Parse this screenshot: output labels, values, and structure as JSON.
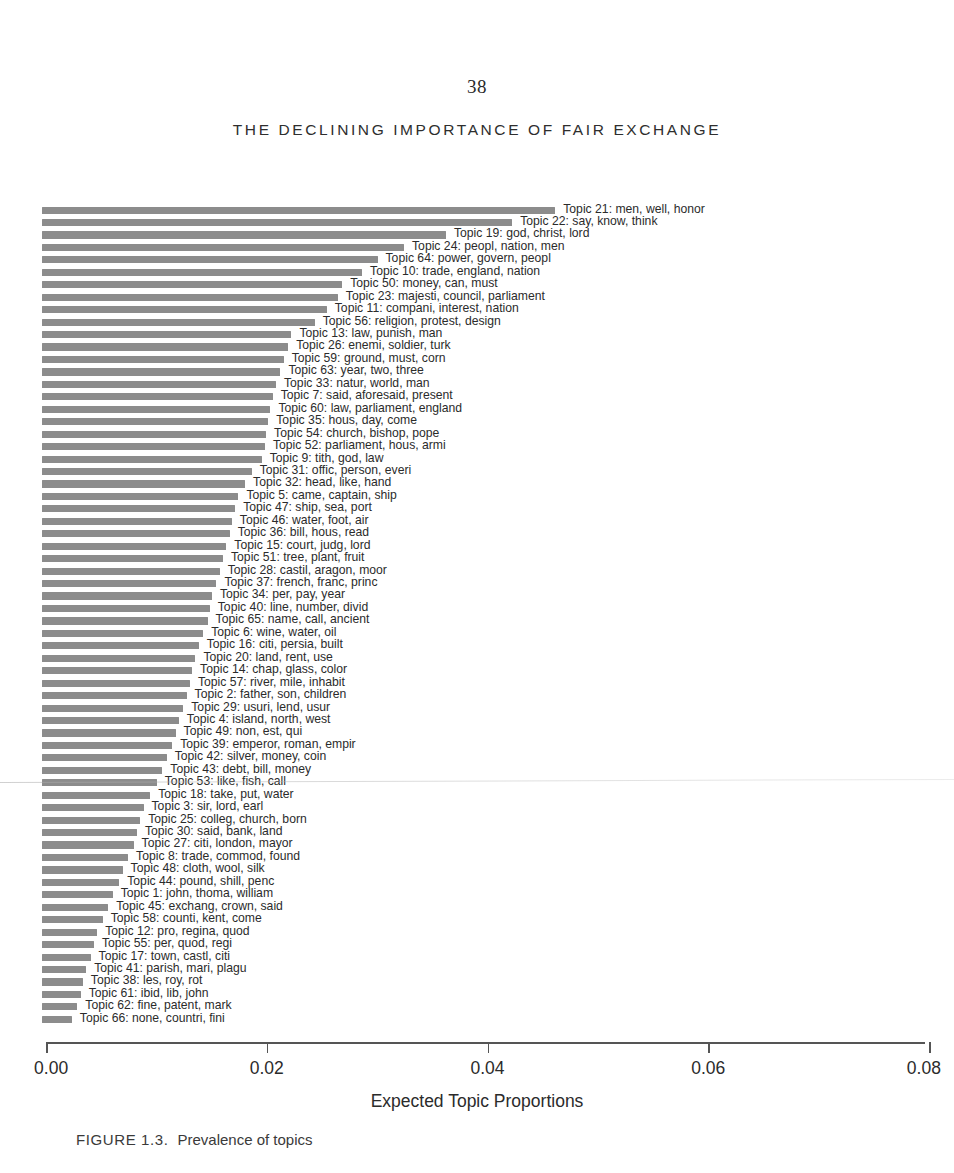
{
  "page": {
    "number": "38",
    "running_head": "THE DECLINING IMPORTANCE OF FAIR EXCHANGE"
  },
  "caption": {
    "figure_number": "FIGURE 1.3.",
    "text": "Prevalence of topics"
  },
  "chart_data": {
    "type": "bar",
    "orientation": "horizontal",
    "title": "Prevalence of topics",
    "xlabel": "Expected Topic Proportions",
    "ylabel": "",
    "xlim": [
      0.0,
      0.08
    ],
    "xticks": [
      "0.00",
      "0.02",
      "0.04",
      "0.06",
      "0.08"
    ],
    "xtick_values": [
      0.0,
      0.02,
      0.04,
      0.06,
      0.08
    ],
    "grid": false,
    "legend": null,
    "bar_color": "#8c8c8c",
    "categories": [
      "Topic 21: men, well, honor",
      "Topic 22: say, know, think",
      "Topic 19: god, christ, lord",
      "Topic 24: peopl, nation, men",
      "Topic 64: power, govern, peopl",
      "Topic 10: trade, england, nation",
      "Topic 50: money, can, must",
      "Topic 23: majesti, council, parliament",
      "Topic 11: compani, interest, nation",
      "Topic 56: religion, protest, design",
      "Topic 13: law, punish, man",
      "Topic 26: enemi, soldier, turk",
      "Topic 59: ground, must, corn",
      "Topic 63: year, two, three",
      "Topic 33: natur, world, man",
      "Topic 7: said, aforesaid, present",
      "Topic 60: law, parliament, england",
      "Topic 35: hous, day, come",
      "Topic 54: church, bishop, pope",
      "Topic 52: parliament, hous, armi",
      "Topic 9: tith, god, law",
      "Topic 31: offic, person, everi",
      "Topic 32: head, like, hand",
      "Topic 5: came, captain, ship",
      "Topic 47: ship, sea, port",
      "Topic 46: water, foot, air",
      "Topic 36: bill, hous, read",
      "Topic 15: court, judg, lord",
      "Topic 51: tree, plant, fruit",
      "Topic 28: castil, aragon, moor",
      "Topic 37: french, franc, princ",
      "Topic 34: per, pay, year",
      "Topic 40: line, number, divid",
      "Topic 65: name, call, ancient",
      "Topic 6: wine, water, oil",
      "Topic 16: citi, persia, built",
      "Topic 20: land, rent, use",
      "Topic 14: chap, glass, color",
      "Topic 57: river, mile, inhabit",
      "Topic 2: father, son, children",
      "Topic 29: usuri, lend, usur",
      "Topic 4: island, north, west",
      "Topic 49: non, est, qui",
      "Topic 39: emperor, roman, empir",
      "Topic 42: silver, money, coin",
      "Topic 43: debt, bill, money",
      "Topic 53: like, fish, call",
      "Topic 18: take, put, water",
      "Topic 3: sir, lord, earl",
      "Topic 25: colleg, church, born",
      "Topic 30: said, bank, land",
      "Topic 27: citi, london, mayor",
      "Topic 8: trade, commod, found",
      "Topic 48: cloth, wool, silk",
      "Topic 44: pound, shill, penc",
      "Topic 1: john, thoma, william",
      "Topic 45: exchang, crown, said",
      "Topic 58: counti, kent, come",
      "Topic 12: pro, regina, quod",
      "Topic 55: per, quod, regi",
      "Topic 17: town, castl, citi",
      "Topic 41: parish, mari, plagu",
      "Topic 38: les, roy, rot",
      "Topic 61: ibid, lib, john",
      "Topic 62: fine, patent, mark",
      "Topic 66: none, countri, fini"
    ],
    "values": [
      0.0465,
      0.0426,
      0.0366,
      0.0328,
      0.0304,
      0.029,
      0.0272,
      0.0268,
      0.0258,
      0.0247,
      0.0226,
      0.0223,
      0.0219,
      0.0216,
      0.0212,
      0.0209,
      0.0207,
      0.0205,
      0.0203,
      0.0202,
      0.0199,
      0.019,
      0.0184,
      0.0178,
      0.0175,
      0.0172,
      0.017,
      0.0167,
      0.0164,
      0.0161,
      0.0158,
      0.0154,
      0.0152,
      0.015,
      0.0146,
      0.0142,
      0.0139,
      0.0136,
      0.0134,
      0.0131,
      0.0128,
      0.0124,
      0.0121,
      0.0118,
      0.0113,
      0.0109,
      0.0104,
      0.0098,
      0.0092,
      0.0089,
      0.0086,
      0.0083,
      0.0078,
      0.0073,
      0.007,
      0.0064,
      0.006,
      0.0055,
      0.005,
      0.0047,
      0.0044,
      0.004,
      0.0037,
      0.0035,
      0.0032,
      0.0027
    ]
  }
}
